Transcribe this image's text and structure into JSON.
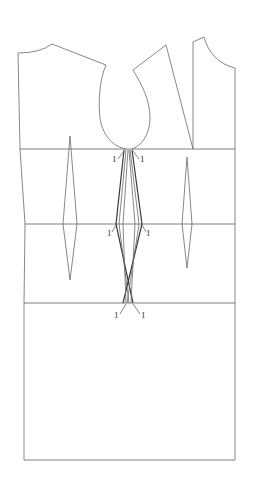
{
  "diagram": {
    "type": "sewing-pattern-draft",
    "line_color": "#6a6a6a",
    "bold_line_color": "#3a3a3a",
    "background": "#ffffff",
    "guide_lines": [
      {
        "name": "chest-line",
        "y": 149
      },
      {
        "name": "waist-line",
        "y": 224
      },
      {
        "name": "hip-line",
        "y": 303
      },
      {
        "name": "hem-line",
        "y": 460
      }
    ],
    "labels": {
      "chest_left": "1",
      "chest_right": "1",
      "waist_left": "1",
      "waist_right": "1",
      "hip_left": "1",
      "hip_right": "1"
    },
    "darts": [
      {
        "name": "back-waist-dart",
        "top": [
          70,
          136
        ],
        "waist_left": [
          63,
          224
        ],
        "waist_right": [
          77,
          224
        ],
        "bottom": [
          70,
          280
        ]
      },
      {
        "name": "front-waist-dart",
        "top": [
          187,
          157
        ],
        "waist_left": [
          182,
          224
        ],
        "waist_right": [
          192,
          224
        ],
        "bottom": [
          187,
          268
        ]
      }
    ]
  }
}
